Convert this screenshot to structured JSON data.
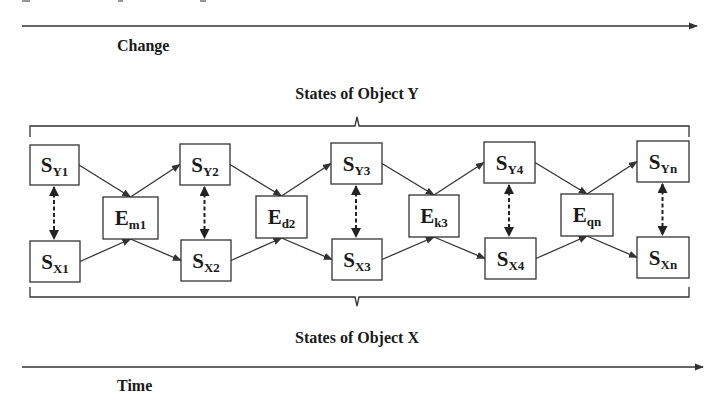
{
  "axes": {
    "top": {
      "label": "Change",
      "y": 26,
      "x1": 22,
      "x2": 697,
      "label_x": 117,
      "label_y": 51
    },
    "bottom": {
      "label": "Time",
      "y": 367,
      "x1": 22,
      "x2": 703,
      "label_x": 117,
      "label_y": 391
    }
  },
  "groups": {
    "object_y": {
      "label": "States of Object Y",
      "label_x": 357,
      "label_y": 99
    },
    "object_x": {
      "label": "States of Object X",
      "label_x": 357,
      "label_y": 343
    }
  },
  "colors": {
    "stroke": "#333333",
    "text": "#1a1a1a",
    "background": "#ffffff"
  },
  "states_y": [
    {
      "id": "SY1",
      "base": "S",
      "sub": "Y1",
      "x": 30,
      "y": 145,
      "w": 49,
      "h": 40
    },
    {
      "id": "SY2",
      "base": "S",
      "sub": "Y2",
      "x": 180,
      "y": 144,
      "w": 50,
      "h": 41
    },
    {
      "id": "SY3",
      "base": "S",
      "sub": "Y3",
      "x": 331,
      "y": 143,
      "w": 51,
      "h": 41
    },
    {
      "id": "SY4",
      "base": "S",
      "sub": "Y4",
      "x": 484,
      "y": 142,
      "w": 51,
      "h": 41
    },
    {
      "id": "SYn",
      "base": "S",
      "sub": "Yn",
      "x": 637,
      "y": 141,
      "w": 52,
      "h": 41
    }
  ],
  "states_x": [
    {
      "id": "SX1",
      "base": "S",
      "sub": "X1",
      "x": 30,
      "y": 241,
      "w": 50,
      "h": 41
    },
    {
      "id": "SX2",
      "base": "S",
      "sub": "X2",
      "x": 181,
      "y": 240,
      "w": 50,
      "h": 41
    },
    {
      "id": "SX3",
      "base": "S",
      "sub": "X3",
      "x": 332,
      "y": 239,
      "w": 50,
      "h": 41
    },
    {
      "id": "SX4",
      "base": "S",
      "sub": "X4",
      "x": 485,
      "y": 238,
      "w": 51,
      "h": 41
    },
    {
      "id": "SXn",
      "base": "S",
      "sub": "Xn",
      "x": 637,
      "y": 237,
      "w": 52,
      "h": 41
    }
  ],
  "events": [
    {
      "id": "Em1",
      "base": "E",
      "sub": "m1",
      "x": 103,
      "y": 197,
      "w": 55,
      "h": 42
    },
    {
      "id": "Ed2",
      "base": "E",
      "sub": "d2",
      "x": 256,
      "y": 196,
      "w": 51,
      "h": 42
    },
    {
      "id": "Ek3",
      "base": "E",
      "sub": "k3",
      "x": 409,
      "y": 195,
      "w": 50,
      "h": 42
    },
    {
      "id": "Eqn",
      "base": "E",
      "sub": "qn",
      "x": 561,
      "y": 194,
      "w": 52,
      "h": 42
    }
  ],
  "brackets": {
    "top": {
      "x1": 30,
      "x2": 689,
      "y": 126,
      "end_y": 137,
      "tick_x": 357,
      "tick_y": 117
    },
    "bottom": {
      "x1": 30,
      "x2": 689,
      "y": 297,
      "end_y": 287,
      "tick_x": 357,
      "tick_y": 306
    }
  }
}
